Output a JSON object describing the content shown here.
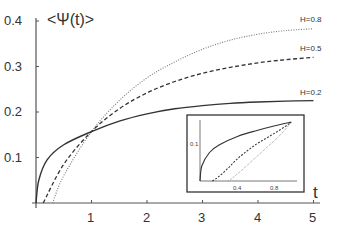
{
  "chart_data": {
    "type": "line",
    "title": "",
    "xlabel": "t",
    "ylabel": "<Ψ(t)>",
    "xlim": [
      0,
      5.2
    ],
    "ylim": [
      0,
      0.4
    ],
    "grid": false,
    "x_ticks": [
      "1",
      "2",
      "3",
      "4",
      "5"
    ],
    "y_ticks": [
      "0.1",
      "0.2",
      "0.3",
      "0.4"
    ],
    "series": [
      {
        "name": "H=0.8",
        "style": "dotted",
        "x": [
          0.3,
          0.5,
          1,
          1.5,
          2,
          2.5,
          3,
          3.5,
          4,
          4.5,
          5
        ],
        "values": [
          0,
          0.06,
          0.157,
          0.225,
          0.275,
          0.31,
          0.338,
          0.358,
          0.371,
          0.379,
          0.383
        ]
      },
      {
        "name": "H=0.5",
        "style": "dashed",
        "x": [
          0.13,
          0.5,
          1,
          1.5,
          2,
          2.5,
          3,
          3.5,
          4,
          4.5,
          5
        ],
        "values": [
          0,
          0.085,
          0.157,
          0.207,
          0.242,
          0.267,
          0.285,
          0.298,
          0.308,
          0.315,
          0.32
        ]
      },
      {
        "name": "H=0.2",
        "style": "solid",
        "x": [
          0,
          0.05,
          0.2,
          0.5,
          1,
          1.5,
          2,
          2.5,
          3,
          3.5,
          4,
          4.5,
          5
        ],
        "values": [
          0,
          0.05,
          0.095,
          0.128,
          0.157,
          0.18,
          0.196,
          0.207,
          0.214,
          0.219,
          0.222,
          0.224,
          0.225
        ]
      }
    ],
    "annotations": [
      "H=0.8",
      "H=0.5",
      "H=0.2"
    ],
    "inset": {
      "xlim": [
        0,
        1.0
      ],
      "ylim": [
        0,
        0.16
      ],
      "x_ticks": [
        "0.4",
        "0.8"
      ],
      "y_ticks": [
        "0.1"
      ],
      "series": [
        {
          "name": "H=0.2",
          "style": "solid",
          "x": [
            0,
            0.02,
            0.1,
            0.2,
            0.4,
            0.6,
            0.8,
            0.96
          ],
          "values": [
            0,
            0.04,
            0.075,
            0.095,
            0.118,
            0.133,
            0.146,
            0.155
          ]
        },
        {
          "name": "H=0.5",
          "style": "dashed",
          "x": [
            0.13,
            0.2,
            0.3,
            0.4,
            0.5,
            0.6,
            0.7,
            0.8,
            0.9,
            0.96
          ],
          "values": [
            0,
            0.012,
            0.035,
            0.06,
            0.08,
            0.098,
            0.113,
            0.128,
            0.144,
            0.155
          ]
        },
        {
          "name": "H=0.8",
          "style": "dotted",
          "x": [
            0.3,
            0.4,
            0.5,
            0.6,
            0.7,
            0.8,
            0.9,
            0.96
          ],
          "values": [
            0,
            0.02,
            0.042,
            0.065,
            0.088,
            0.11,
            0.136,
            0.155
          ]
        }
      ]
    }
  },
  "labels": {
    "ylabel": "<Ψ(t)>",
    "xlabel": "t",
    "y_ticks": [
      "0.4",
      "0.3",
      "0.2",
      "0.1"
    ],
    "x_ticks": [
      "1",
      "2",
      "3",
      "4",
      "5"
    ],
    "curve_labels": [
      "H=0.8",
      "H=0.5",
      "H=0.2"
    ],
    "inset_y_tick": "0.1",
    "inset_x_ticks": [
      "0.4",
      "0.8"
    ]
  },
  "colors": {
    "axis": "#555555",
    "curve": "#333333",
    "dotted_curve": "#777777",
    "inset_frame": "#333333"
  }
}
